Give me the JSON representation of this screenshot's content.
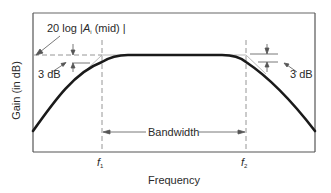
{
  "diagram": {
    "y_axis_label": "Gain (in dB)",
    "x_axis_label": "Frequency",
    "midband_label": {
      "prefix": "20 log |",
      "symbol": "A",
      "subscript": "i",
      "suffix": " (mid) |"
    },
    "left_3db_label": "3 dB",
    "right_3db_label": "3 dB",
    "bandwidth_label": "Bandwidth",
    "f1_label": {
      "symbol": "f",
      "subscript": "1"
    },
    "f2_label": {
      "symbol": "f",
      "subscript": "2"
    },
    "colors": {
      "curve": "#1a1a1a",
      "frame": "#555555",
      "dashed": "#8a8a8a",
      "annotation": "#444444",
      "text": "#2a2a2a"
    }
  }
}
